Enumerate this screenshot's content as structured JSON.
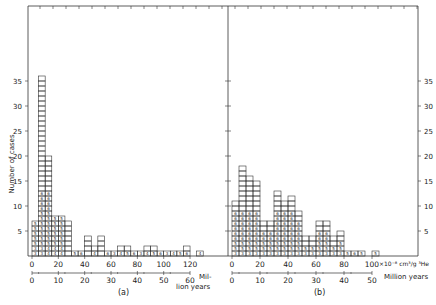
{
  "chart_data": [
    {
      "type": "bar",
      "panel_label": "(a)",
      "ylabel": "Number of cases",
      "xlabel_primary": "×10⁻⁸ cm³/g ⁴He (implicit)",
      "xlabel_secondary": "Million years",
      "x_ticks_primary": [
        "0",
        "20",
        "40",
        "60",
        "80",
        "100",
        "120"
      ],
      "x_ticks_secondary": [
        "0",
        "10",
        "20",
        "30",
        "40",
        "50",
        "60"
      ],
      "secondary_unit_label": "Mil- lion years",
      "y_ticks": [
        "5",
        "10",
        "15",
        "20",
        "25",
        "30",
        "35"
      ],
      "ylim": [
        0,
        37
      ],
      "bin_width": 5,
      "bins_start": [
        0,
        5,
        10,
        15,
        20,
        25,
        30,
        35,
        40,
        45,
        50,
        55,
        60,
        65,
        70,
        75,
        80,
        85,
        90,
        95,
        100,
        105,
        110,
        115,
        120,
        125
      ],
      "values": [
        7,
        36,
        20,
        8,
        8,
        7,
        1,
        1,
        4,
        2,
        4,
        1,
        1,
        2,
        2,
        1,
        1,
        2,
        2,
        1,
        1,
        1,
        1,
        2,
        0,
        1
      ],
      "grid": false
    },
    {
      "type": "bar",
      "panel_label": "(b)",
      "ylabel": "Number of cases",
      "xlabel_primary": "×10⁻⁸ cm³/g ³He",
      "xlabel_secondary": "Million years",
      "x_ticks_primary": [
        "0",
        "20",
        "40",
        "60",
        "80",
        "100"
      ],
      "x_ticks_secondary": [
        "0",
        "10",
        "20",
        "30",
        "40",
        "50"
      ],
      "y_ticks": [
        "5",
        "10",
        "15",
        "20",
        "25",
        "30",
        "35"
      ],
      "ylim": [
        0,
        37
      ],
      "bin_width": 5,
      "bins_start": [
        0,
        5,
        10,
        15,
        20,
        25,
        30,
        35,
        40,
        45,
        50,
        55,
        60,
        65,
        70,
        75,
        80,
        85,
        90,
        95,
        100
      ],
      "values": [
        11,
        18,
        16,
        15,
        7,
        7,
        13,
        11,
        12,
        9,
        4,
        4,
        7,
        7,
        4,
        5,
        1,
        1,
        1,
        0,
        1
      ],
      "grid": false
    }
  ],
  "labels": {
    "ylabel": "Number of cases",
    "panel_a": "(a)",
    "panel_b": "(b)",
    "a_unit_line1": "Mil-",
    "a_unit_line2": "lion years",
    "b_unit_primary": "×10⁻⁸ cm³/g ³He",
    "b_unit_secondary": "Million years"
  }
}
